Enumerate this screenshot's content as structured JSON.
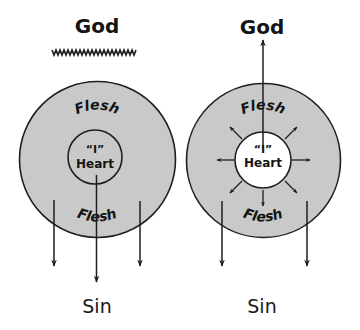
{
  "colors": {
    "background": "#ffffff",
    "outer_circle_fill": "#c9c9c9",
    "inner_circle_fill_left": "#c9c9c9",
    "inner_circle_fill_right": "#ffffff",
    "stroke": "#1e1e1e"
  },
  "left_diagram": {
    "top_label": "God",
    "separator": "wwwwwwwwwww",
    "outer_top_label": "Flesh",
    "outer_bottom_label": "Flesh",
    "inner_quote": "“I”",
    "inner_label": "Heart",
    "bottom_label": "Sin",
    "arrows": [
      "down-arrow-left",
      "down-arrow-center",
      "down-arrow-right"
    ]
  },
  "right_diagram": {
    "top_label": "God",
    "outer_top_label": "Flesh",
    "outer_bottom_label": "Flesh",
    "inner_quote": "“I”",
    "inner_label": "Heart",
    "bottom_label": "Sin",
    "arrows": [
      "up-arrow-to-god",
      "radial-arrows-8",
      "down-arrow-left",
      "down-arrow-right"
    ]
  }
}
